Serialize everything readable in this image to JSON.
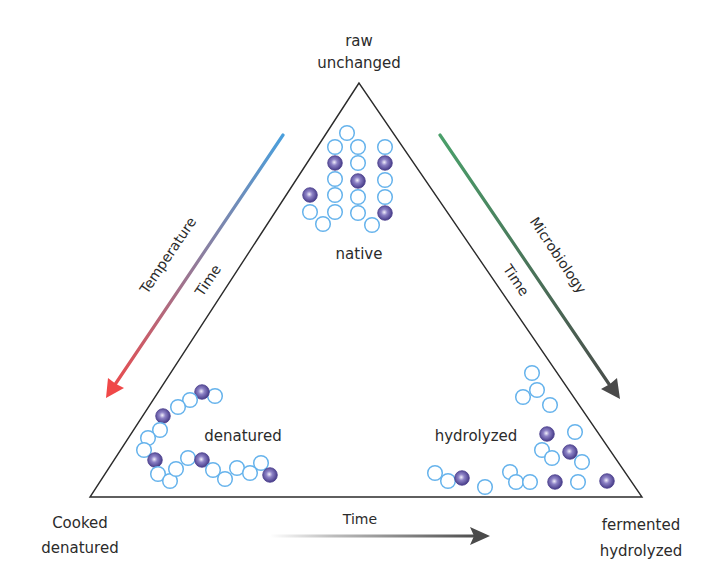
{
  "diagram": {
    "vertices": {
      "top": {
        "line1": "raw",
        "line2": "unchanged"
      },
      "bottom_left": {
        "line1": "Cooked",
        "line2": "denatured"
      },
      "bottom_right": {
        "line1": "fermented",
        "line2": "hydrolyzed"
      }
    },
    "states": {
      "native": "native",
      "denatured": "denatured",
      "hydrolyzed": "hydrolyzed"
    },
    "arrows": {
      "left": {
        "label": "Temperature",
        "time_label": "Time",
        "color_start": "#4a9fdc",
        "color_end": "#f04848"
      },
      "right": {
        "label": "Microbiology",
        "time_label": "Time",
        "color_start": "#4aa06a",
        "color_end": "#4a4a4a"
      },
      "bottom": {
        "label": "Time",
        "color_start": "#e6e6e6",
        "color_end": "#4a4a4a"
      }
    },
    "colors": {
      "outline": "#2b2b2b",
      "bead_ring": "#66b3ec",
      "bead_dark": "#4b3f8e",
      "bead_dark_highlight": "#d9d4f2"
    },
    "beads": {
      "native": [
        {
          "x": 347,
          "y": 133,
          "d": 0
        },
        {
          "x": 335,
          "y": 147,
          "d": 0
        },
        {
          "x": 335,
          "y": 163,
          "d": 1
        },
        {
          "x": 335,
          "y": 179,
          "d": 0
        },
        {
          "x": 335,
          "y": 195,
          "d": 0
        },
        {
          "x": 335,
          "y": 212,
          "d": 0
        },
        {
          "x": 323,
          "y": 224,
          "d": 0
        },
        {
          "x": 310,
          "y": 212,
          "d": 0
        },
        {
          "x": 310,
          "y": 195,
          "d": 1
        },
        {
          "x": 358,
          "y": 147,
          "d": 0
        },
        {
          "x": 358,
          "y": 163,
          "d": 0
        },
        {
          "x": 358,
          "y": 181,
          "d": 1
        },
        {
          "x": 358,
          "y": 197,
          "d": 0
        },
        {
          "x": 358,
          "y": 213,
          "d": 0
        },
        {
          "x": 372,
          "y": 225,
          "d": 0
        },
        {
          "x": 385,
          "y": 147,
          "d": 0
        },
        {
          "x": 385,
          "y": 163,
          "d": 1
        },
        {
          "x": 385,
          "y": 180,
          "d": 0
        },
        {
          "x": 385,
          "y": 197,
          "d": 0
        },
        {
          "x": 385,
          "y": 213,
          "d": 1
        }
      ],
      "denatured": [
        {
          "x": 215,
          "y": 396,
          "d": 0
        },
        {
          "x": 202,
          "y": 392,
          "d": 1
        },
        {
          "x": 190,
          "y": 400,
          "d": 0
        },
        {
          "x": 178,
          "y": 407,
          "d": 0
        },
        {
          "x": 163,
          "y": 416,
          "d": 1
        },
        {
          "x": 160,
          "y": 430,
          "d": 0
        },
        {
          "x": 148,
          "y": 438,
          "d": 0
        },
        {
          "x": 144,
          "y": 450,
          "d": 0
        },
        {
          "x": 155,
          "y": 460,
          "d": 1
        },
        {
          "x": 158,
          "y": 474,
          "d": 0
        },
        {
          "x": 170,
          "y": 481,
          "d": 0
        },
        {
          "x": 176,
          "y": 469,
          "d": 0
        },
        {
          "x": 188,
          "y": 458,
          "d": 0
        },
        {
          "x": 202,
          "y": 460,
          "d": 1
        },
        {
          "x": 213,
          "y": 470,
          "d": 0
        },
        {
          "x": 225,
          "y": 479,
          "d": 0
        },
        {
          "x": 237,
          "y": 468,
          "d": 0
        },
        {
          "x": 250,
          "y": 473,
          "d": 0
        },
        {
          "x": 261,
          "y": 463,
          "d": 0
        },
        {
          "x": 270,
          "y": 475,
          "d": 1
        }
      ],
      "hydrolyzed": [
        {
          "x": 532,
          "y": 373,
          "d": 0
        },
        {
          "x": 537,
          "y": 390,
          "d": 0
        },
        {
          "x": 523,
          "y": 397,
          "d": 0
        },
        {
          "x": 550,
          "y": 405,
          "d": 0
        },
        {
          "x": 547,
          "y": 434,
          "d": 1
        },
        {
          "x": 575,
          "y": 432,
          "d": 0
        },
        {
          "x": 542,
          "y": 450,
          "d": 0
        },
        {
          "x": 552,
          "y": 458,
          "d": 0
        },
        {
          "x": 570,
          "y": 452,
          "d": 1
        },
        {
          "x": 582,
          "y": 462,
          "d": 0
        },
        {
          "x": 435,
          "y": 473,
          "d": 0
        },
        {
          "x": 448,
          "y": 481,
          "d": 0
        },
        {
          "x": 462,
          "y": 478,
          "d": 1
        },
        {
          "x": 485,
          "y": 487,
          "d": 0
        },
        {
          "x": 510,
          "y": 472,
          "d": 0
        },
        {
          "x": 516,
          "y": 482,
          "d": 0
        },
        {
          "x": 530,
          "y": 482,
          "d": 0
        },
        {
          "x": 555,
          "y": 482,
          "d": 1
        },
        {
          "x": 578,
          "y": 482,
          "d": 0
        },
        {
          "x": 607,
          "y": 481,
          "d": 1
        }
      ]
    }
  }
}
